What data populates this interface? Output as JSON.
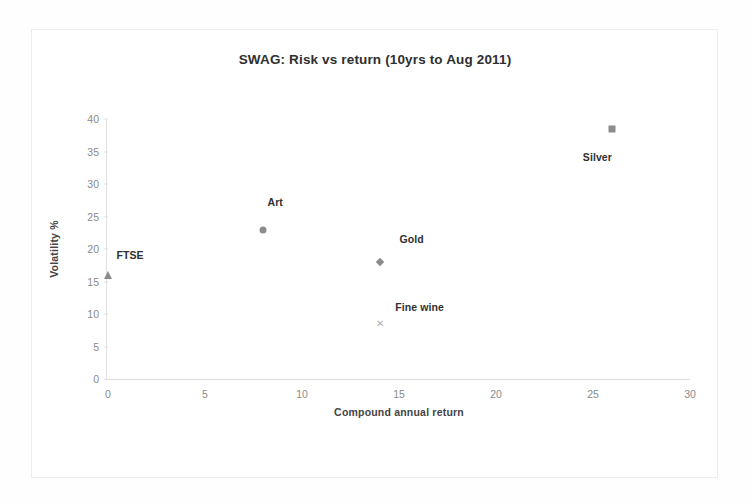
{
  "figure": {
    "title": "SWAG: Risk vs return (10yrs to Aug 2011)"
  },
  "chart_data": {
    "type": "scatter",
    "title": "SWAG: Risk vs return (10yrs to Aug 2011)",
    "xlabel": "Compound annual return",
    "ylabel": "Volatility %",
    "xlim": [
      0,
      30
    ],
    "ylim": [
      0,
      40
    ],
    "xticks": [
      "0",
      "5",
      "10",
      "15",
      "20",
      "25",
      "30"
    ],
    "yticks": [
      "0",
      "5",
      "10",
      "15",
      "20",
      "25",
      "30",
      "35",
      "40"
    ],
    "grid": false,
    "legend": "none (points labelled directly)",
    "points": [
      {
        "name": "FTSE",
        "x": 0,
        "y": 16,
        "marker": "triangle",
        "label": "FTSE",
        "label_dx": 22,
        "label_dy": -20
      },
      {
        "name": "Art",
        "x": 8,
        "y": 23,
        "marker": "circle",
        "label": "Art",
        "label_dx": 12,
        "label_dy": -28
      },
      {
        "name": "Gold",
        "x": 14,
        "y": 18,
        "marker": "diamond",
        "label": "Gold",
        "label_dx": 32,
        "label_dy": -23
      },
      {
        "name": "Fine wine",
        "x": 14,
        "y": 8.5,
        "marker": "cross",
        "label": "Fine wine",
        "label_dx": 40,
        "label_dy": -17
      },
      {
        "name": "Silver",
        "x": 26,
        "y": 38.5,
        "marker": "square",
        "label": "Silver",
        "label_dx": -15,
        "label_dy": 28
      }
    ]
  }
}
